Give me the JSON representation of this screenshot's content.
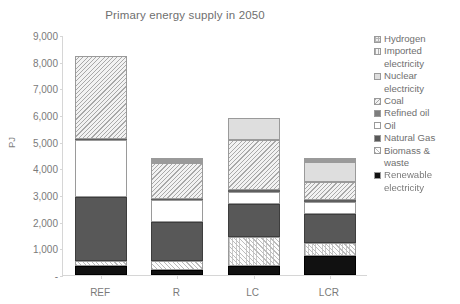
{
  "chart_data": {
    "type": "bar",
    "subtype": "stacked-bar",
    "title": "Primary energy supply in 2050",
    "xlabel": "",
    "ylabel": "PJ",
    "categories": [
      "REF",
      "R",
      "LC",
      "LCR"
    ],
    "ylim": [
      0,
      9000
    ],
    "yticks": [
      0,
      1000,
      2000,
      3000,
      4000,
      5000,
      6000,
      7000,
      8000,
      9000
    ],
    "ytick_labels": [
      "-",
      "1,000",
      "2,000",
      "3,000",
      "4,000",
      "5,000",
      "6,000",
      "7,000",
      "8,000",
      "9,000"
    ],
    "grid": false,
    "legend_position": "right",
    "stack_order_bottom_to_top": [
      "Renewable electricity",
      "Biomass & waste",
      "Natural Gas",
      "Oil",
      "Refined oil",
      "Coal",
      "Nuclear electricity",
      "Imported electricity",
      "Hydrogen"
    ],
    "series": [
      {
        "name": "Renewable electricity",
        "values": [
          350,
          200,
          330,
          700
        ]
      },
      {
        "name": "Biomass & waste",
        "values": [
          180,
          330,
          1090,
          500
        ]
      },
      {
        "name": "Natural Gas",
        "values": [
          2380,
          1470,
          1230,
          1100
        ]
      },
      {
        "name": "Oil",
        "values": [
          2150,
          800,
          450,
          440
        ]
      },
      {
        "name": "Refined oil",
        "values": [
          50,
          60,
          80,
          80
        ]
      },
      {
        "name": "Coal",
        "values": [
          3120,
          1340,
          1880,
          660
        ]
      },
      {
        "name": "Nuclear electricity",
        "values": [
          0,
          40,
          810,
          760
        ]
      },
      {
        "name": "Imported electricity",
        "values": [
          0,
          70,
          0,
          70
        ]
      },
      {
        "name": "Hydrogen",
        "values": [
          0,
          40,
          0,
          40
        ]
      }
    ],
    "totals": [
      8230,
      4350,
      5870,
      4350
    ]
  },
  "legend": {
    "items": [
      {
        "label": "Hydrogen",
        "swatch": "hydrogen-swatch"
      },
      {
        "label": "Imported\nelectricity",
        "swatch": "imported-electricity-swatch"
      },
      {
        "label": "Nuclear\nelectricity",
        "swatch": "nuclear-electricity-swatch"
      },
      {
        "label": "Coal",
        "swatch": "coal-swatch"
      },
      {
        "label": "Refined oil",
        "swatch": "refined-oil-swatch"
      },
      {
        "label": "Oil",
        "swatch": "oil-swatch"
      },
      {
        "label": "Natural Gas",
        "swatch": "natural-gas-swatch"
      },
      {
        "label": "Biomass &\nwaste",
        "swatch": "biomass-waste-swatch"
      },
      {
        "label": "Renewable\nelectricity",
        "swatch": "renewable-electricity-swatch"
      }
    ]
  },
  "colors": {
    "renewable_electricity": "#111111",
    "natural_gas": "#585858",
    "refined_oil": "#7d7d7d",
    "oil": "#ffffff",
    "nuclear_electricity": "#dedede",
    "biomass_waste": "#fdfdfd",
    "coal": "#f2f2f2",
    "imported_electricity": "#f6f6f6",
    "hydrogen": "#eeeeee",
    "axis": "#d6d6d6",
    "text": "#6f6f6f"
  }
}
